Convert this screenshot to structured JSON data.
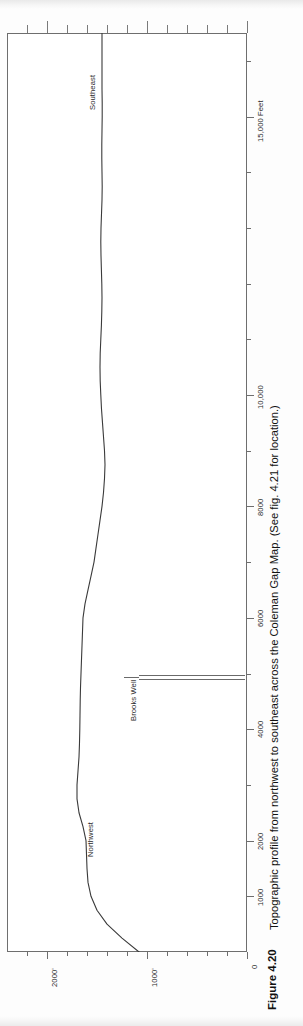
{
  "figure": {
    "number_label": "Figure 4.20",
    "caption": "Topographic profile from northwest to southeast across the Coleman Gap Map. (See fig. 4.21 for location.)",
    "orientation": "rotated-90-ccw",
    "line_color": "#3a3a3a",
    "frame_color": "#6e6e6e",
    "background": "#ffffff"
  },
  "annotations": {
    "left_end_label": "Northwest",
    "right_end_label": "Southeast",
    "well_label": "Brooks Well"
  },
  "chart_data": {
    "type": "line",
    "title": "Topographic profile from northwest to southeast across the Coleman Gap Map.",
    "subtitle": "Figure 4.20",
    "xlabel": "15,000 Feet",
    "ylabel": "Elevation (feet)",
    "xlim": [
      0,
      16500
    ],
    "ylim": [
      0,
      2400
    ],
    "grid": false,
    "legend": "none",
    "x_axis": {
      "units": "Feet",
      "unit_label": "15,000 Feet",
      "major_ticks": [
        1000,
        2000,
        4000,
        6000,
        8000,
        10000,
        15000
      ],
      "major_tick_labels": [
        "1000",
        "2000",
        "4000",
        "6000",
        "8000",
        "10,000",
        "15,000 Feet"
      ],
      "minor_tick_interval": 1000,
      "direction": "northwest-to-southeast"
    },
    "y_axis": {
      "units": "feet",
      "major_ticks": [
        0,
        1000,
        2000
      ],
      "major_tick_labels": [
        "0",
        "1000'",
        "2000'"
      ],
      "minor_tick_interval": 200
    },
    "annotations": [
      {
        "text": "Northwest",
        "x": 1200,
        "note": "left end of profile"
      },
      {
        "text": "Southeast",
        "x": 14200,
        "note": "right end of profile"
      },
      {
        "text": "Brooks Well",
        "x": 5700,
        "note": "well location marker, casing drawn to depth"
      }
    ],
    "well_marker": {
      "label": "Brooks Well",
      "x": 5700,
      "surface_elevation": 1480,
      "depth_to": 0
    },
    "x": [
      0,
      250,
      500,
      750,
      1000,
      1250,
      1500,
      1750,
      2000,
      2250,
      2500,
      2750,
      3000,
      3250,
      3500,
      3750,
      4000,
      4250,
      4500,
      4750,
      5000,
      5250,
      5500,
      5750,
      6000,
      6250,
      6500,
      6750,
      7000,
      7250,
      7500,
      7750,
      8000,
      8250,
      8500,
      8750,
      9000,
      9250,
      9500,
      9750,
      10000,
      10250,
      10500,
      10750,
      11000,
      11250,
      11500,
      11750,
      12000,
      12250,
      12500,
      12750,
      13000,
      13250,
      13500,
      13750,
      14000,
      14250,
      14500,
      14750,
      15000,
      15250,
      15500,
      15750,
      16000,
      16250,
      16500
    ],
    "y": [
      1080,
      1250,
      1400,
      1500,
      1560,
      1590,
      1600,
      1605,
      1610,
      1640,
      1680,
      1700,
      1700,
      1690,
      1680,
      1675,
      1672,
      1670,
      1668,
      1665,
      1660,
      1655,
      1650,
      1645,
      1640,
      1620,
      1590,
      1560,
      1530,
      1510,
      1490,
      1470,
      1450,
      1435,
      1425,
      1420,
      1425,
      1435,
      1445,
      1455,
      1462,
      1468,
      1470,
      1468,
      1462,
      1456,
      1452,
      1450,
      1452,
      1456,
      1460,
      1462,
      1460,
      1455,
      1450,
      1448,
      1450,
      1452,
      1452,
      1450,
      1448,
      1448,
      1450,
      1450,
      1450,
      1450,
      1450
    ],
    "series": [
      {
        "name": "Topographic surface",
        "color": "#3a3a3a",
        "values": [
          1080,
          1250,
          1400,
          1500,
          1560,
          1590,
          1600,
          1605,
          1610,
          1640,
          1680,
          1700,
          1700,
          1690,
          1680,
          1675,
          1672,
          1670,
          1668,
          1665,
          1660,
          1655,
          1650,
          1645,
          1640,
          1620,
          1590,
          1560,
          1530,
          1510,
          1490,
          1470,
          1450,
          1435,
          1425,
          1420,
          1425,
          1435,
          1445,
          1455,
          1462,
          1468,
          1470,
          1468,
          1462,
          1456,
          1452,
          1450,
          1452,
          1456,
          1460,
          1462,
          1460,
          1455,
          1450,
          1448,
          1450,
          1452,
          1452,
          1450,
          1448,
          1448,
          1450,
          1450,
          1450,
          1450,
          1450
        ]
      }
    ]
  }
}
